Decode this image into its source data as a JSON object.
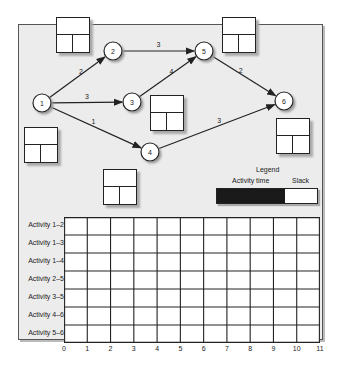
{
  "network": {
    "nodes": [
      {
        "id": "1",
        "x": 42,
        "y": 103
      },
      {
        "id": "2",
        "x": 113,
        "y": 51
      },
      {
        "id": "3",
        "x": 132,
        "y": 102
      },
      {
        "id": "4",
        "x": 150,
        "y": 152
      },
      {
        "id": "5",
        "x": 204,
        "y": 51
      },
      {
        "id": "6",
        "x": 284,
        "y": 101
      }
    ],
    "activities": [
      {
        "from": "1",
        "to": "2",
        "time": "2"
      },
      {
        "from": "1",
        "to": "3",
        "time": "3"
      },
      {
        "from": "1",
        "to": "4",
        "time": "1"
      },
      {
        "from": "2",
        "to": "5",
        "time": "3"
      },
      {
        "from": "3",
        "to": "5",
        "time": "4"
      },
      {
        "from": "4",
        "to": "6",
        "time": "3"
      },
      {
        "from": "5",
        "to": "6",
        "time": "2"
      }
    ]
  },
  "legend": {
    "title": "Legend",
    "activity_label": "Activity time",
    "slack_label": "Slack",
    "activity_color": "#1a1a1a",
    "slack_color": "#ffffff"
  },
  "gantt": {
    "rows": [
      "Activity 1–2",
      "Activity 1–3",
      "Activity 1–4",
      "Activity 2–5",
      "Activity 3–5",
      "Activity 4–6",
      "Activity 5–6"
    ],
    "ticks": [
      "0",
      "1",
      "2",
      "3",
      "4",
      "5",
      "6",
      "7",
      "8",
      "9",
      "10",
      "11"
    ]
  }
}
